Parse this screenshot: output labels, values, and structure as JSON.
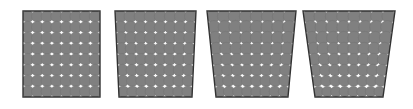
{
  "figure": {
    "title": "",
    "background_color": "#ffffff",
    "width": 413,
    "height": 109,
    "circle_fill": "#808080",
    "circle_edge": "#6e6e6e",
    "gap_color": "#ffffff",
    "border_color": "#333333",
    "border_width": 1.4,
    "grid": {
      "columns": 8,
      "rows": 8,
      "circle_radius_ratio": 0.62,
      "description": "grid of overlapping gray circles leaving small white concave gaps"
    },
    "panels": [
      {
        "index": 1,
        "name": "panel-no-taper",
        "label": "",
        "taper": 0.0,
        "top_left_x": 23,
        "top_right_x": 100,
        "bottom_left_x": 23,
        "bottom_right_x": 100,
        "top_y": 11,
        "bottom_y": 97
      },
      {
        "index": 2,
        "name": "panel-slight-taper",
        "label": "",
        "taper": 0.06,
        "top_left_x": 115,
        "top_right_x": 196,
        "bottom_left_x": 119,
        "bottom_right_x": 192,
        "top_y": 11,
        "bottom_y": 97
      },
      {
        "index": 3,
        "name": "panel-medium-taper",
        "label": "",
        "taper": 0.16,
        "top_left_x": 207,
        "top_right_x": 296,
        "bottom_left_x": 216,
        "bottom_right_x": 288,
        "top_y": 11,
        "bottom_y": 97
      },
      {
        "index": 4,
        "name": "panel-strong-taper",
        "label": "",
        "taper": 0.26,
        "top_left_x": 303,
        "top_right_x": 395,
        "bottom_left_x": 315,
        "bottom_right_x": 383,
        "top_y": 11,
        "bottom_y": 97
      }
    ]
  }
}
